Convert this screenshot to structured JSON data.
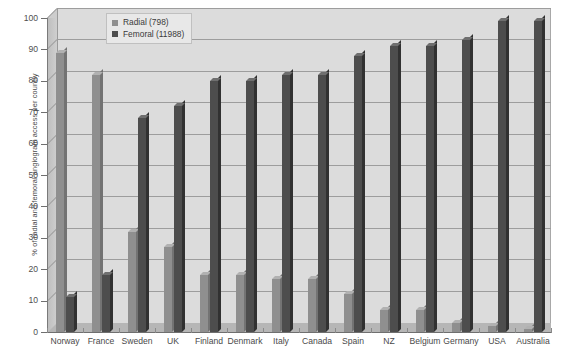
{
  "chart_data": {
    "type": "bar",
    "title": "",
    "xlabel": "",
    "ylabel": "% of radial and femoral angiogram access per country",
    "ylim": [
      0,
      100
    ],
    "ytick_step": 10,
    "yticks": [
      0,
      10,
      20,
      30,
      40,
      50,
      60,
      70,
      80,
      90,
      100
    ],
    "grid": true,
    "legend_position": "top-left-inside",
    "categories": [
      "Norway",
      "France",
      "Sweden",
      "UK",
      "Finland",
      "Denmark",
      "Italy",
      "Canada",
      "Spain",
      "NZ",
      "Belgium",
      "Germany",
      "USA",
      "Australia"
    ],
    "series": [
      {
        "name": "Radial (798)",
        "color": "#8f8f8f",
        "values": [
          89,
          82,
          32,
          27,
          18,
          18,
          17,
          17,
          12,
          7,
          7,
          3,
          2,
          1
        ]
      },
      {
        "name": "Femoral (11988)",
        "color": "#4d4d4d",
        "values": [
          11,
          18,
          68,
          72,
          80,
          80,
          82,
          82,
          88,
          91,
          91,
          93,
          99,
          99
        ]
      }
    ]
  },
  "legend": {
    "items": [
      {
        "label": "Radial (798)"
      },
      {
        "label": "Femoral (11988)"
      }
    ]
  },
  "axes": {
    "y_title": "% of radial and femoral angiogram access per country",
    "y_tick_labels": [
      "0",
      "10",
      "20",
      "30",
      "40",
      "50",
      "60",
      "70",
      "80",
      "90",
      "100"
    ],
    "x_tick_labels": [
      "Norway",
      "France",
      "Sweden",
      "UK",
      "Finland",
      "Denmark",
      "Italy",
      "Canada",
      "Spain",
      "NZ",
      "Belgium",
      "Germany",
      "USA",
      "Australia"
    ]
  },
  "colors": {
    "radial": "#8f8f8f",
    "femoral": "#4d4d4d",
    "plot_background": "#dcdcdc",
    "page_background": "#ffffff",
    "gridline": "#9d9d9d",
    "text": "#4a4a4a"
  }
}
